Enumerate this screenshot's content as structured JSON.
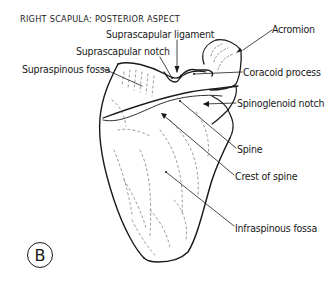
{
  "figure": {
    "title": "RIGHT SCAPULA: POSTERIOR ASPECT",
    "panel_letter": "B",
    "labels": {
      "suprascapular_ligament": "Suprascapular ligament",
      "suprascapular_notch": "Suprascapular notch",
      "supraspinous_fossa": "Supraspinous fossa",
      "acromion": "Acromion",
      "coracoid_process": "Coracoid process",
      "spinoglenoid_notch": "Spinoglenoid notch",
      "spine": "Spine",
      "crest_of_spine": "Crest of spine",
      "infraspinous_fossa": "Infraspinous fossa"
    },
    "colors": {
      "line": "#1a1a1a",
      "shading": "#555555",
      "background": "#ffffff"
    }
  }
}
